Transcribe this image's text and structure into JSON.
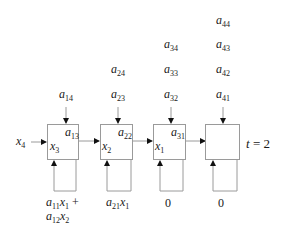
{
  "diagram": {
    "type": "systolic-array-snapshot",
    "time_label": {
      "var": "t",
      "eq": " = 2"
    },
    "input": {
      "var": "x",
      "sub": "4"
    },
    "cells": [
      {
        "id": 1,
        "top_inputs": [
          {
            "var": "a",
            "sub": "14"
          }
        ],
        "weight": {
          "var": "a",
          "sub": "13"
        },
        "state": {
          "var": "x",
          "sub": "3"
        },
        "accumulator": {
          "line1": [
            {
              "var": "a",
              "sub": "11"
            },
            {
              "var": "x",
              "sub": "1"
            },
            {
              "text": " +"
            }
          ],
          "line2": [
            {
              "var": "a",
              "sub": "12"
            },
            {
              "var": "x",
              "sub": "2"
            }
          ]
        }
      },
      {
        "id": 2,
        "top_inputs": [
          {
            "var": "a",
            "sub": "24"
          },
          {
            "var": "a",
            "sub": "23"
          }
        ],
        "weight": {
          "var": "a",
          "sub": "22"
        },
        "state": {
          "var": "x",
          "sub": "2"
        },
        "accumulator": {
          "line1": [
            {
              "var": "a",
              "sub": "21"
            },
            {
              "var": "x",
              "sub": "1"
            }
          ]
        }
      },
      {
        "id": 3,
        "top_inputs": [
          {
            "var": "a",
            "sub": "34"
          },
          {
            "var": "a",
            "sub": "33"
          },
          {
            "var": "a",
            "sub": "32"
          }
        ],
        "weight": {
          "var": "a",
          "sub": "31"
        },
        "state": {
          "var": "x",
          "sub": "1"
        },
        "accumulator": {
          "value": "0"
        }
      },
      {
        "id": 4,
        "top_inputs": [
          {
            "var": "a",
            "sub": "44"
          },
          {
            "var": "a",
            "sub": "43"
          },
          {
            "var": "a",
            "sub": "42"
          },
          {
            "var": "a",
            "sub": "41"
          }
        ],
        "weight": null,
        "state": null,
        "accumulator": {
          "value": "0"
        }
      }
    ]
  },
  "labels": {
    "a14": {
      "v": "a",
      "s": "14"
    },
    "a24": {
      "v": "a",
      "s": "24"
    },
    "a23": {
      "v": "a",
      "s": "23"
    },
    "a34": {
      "v": "a",
      "s": "34"
    },
    "a33": {
      "v": "a",
      "s": "33"
    },
    "a32": {
      "v": "a",
      "s": "32"
    },
    "a44": {
      "v": "a",
      "s": "44"
    },
    "a43": {
      "v": "a",
      "s": "43"
    },
    "a42": {
      "v": "a",
      "s": "42"
    },
    "a41": {
      "v": "a",
      "s": "41"
    },
    "a13": {
      "v": "a",
      "s": "13"
    },
    "a22": {
      "v": "a",
      "s": "22"
    },
    "a31": {
      "v": "a",
      "s": "31"
    },
    "x4": {
      "v": "x",
      "s": "4"
    },
    "x3": {
      "v": "x",
      "s": "3"
    },
    "x2": {
      "v": "x",
      "s": "2"
    },
    "x1": {
      "v": "x",
      "s": "1"
    },
    "acc1_a11": {
      "v": "a",
      "s": "11"
    },
    "acc1_x1": {
      "v": "x",
      "s": "1"
    },
    "acc1_plus": " +",
    "acc1_a12": {
      "v": "a",
      "s": "12"
    },
    "acc1_x2": {
      "v": "x",
      "s": "2"
    },
    "acc2_a21": {
      "v": "a",
      "s": "21"
    },
    "acc2_x1": {
      "v": "x",
      "s": "1"
    },
    "acc3": "0",
    "acc4": "0",
    "t_var": "t",
    "t_eq": " = 2"
  }
}
